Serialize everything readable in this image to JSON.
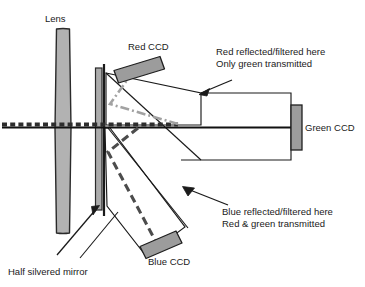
{
  "figure": {
    "background": "#ffffff",
    "ink": "#1a1a1a"
  },
  "colors": {
    "ink": "#1a1a1a",
    "glass_fill": "#ffffff",
    "ccd_fill": "#9a9a9a",
    "lens_fill": "#b0b0b0",
    "mirror_fill": "#a8a8a8",
    "red_ray": "#a0a0a0",
    "blue_ray": "#4a4a4a",
    "axis": "#111111"
  },
  "labels": {
    "lens": "Lens",
    "red_ccd": "Red CCD",
    "blue_ccd": "Blue CCD",
    "green_ccd": "Green CCD",
    "half_silvered_mirror": "Half silvered mirror",
    "red_note_line1": "Red reflected/filtered here",
    "red_note_line2": "Only green transmitted",
    "blue_note_line1": "Blue reflected/filtered here",
    "blue_note_line2": "Red & green transmitted"
  },
  "components": [
    {
      "name": "lens",
      "kind": "optic",
      "label": "Lens"
    },
    {
      "name": "half-silvered-mirror",
      "kind": "optic",
      "label": "Half silvered mirror"
    },
    {
      "name": "red-dichroic-prism",
      "kind": "prism",
      "label": "Red reflected/filtered here"
    },
    {
      "name": "blue-dichroic-prism",
      "kind": "prism",
      "label": "Blue reflected/filtered here"
    },
    {
      "name": "red-ccd",
      "kind": "sensor",
      "label": "Red CCD"
    },
    {
      "name": "green-ccd",
      "kind": "sensor",
      "label": "Green CCD"
    },
    {
      "name": "blue-ccd",
      "kind": "sensor",
      "label": "Blue CCD"
    }
  ],
  "rays": [
    {
      "name": "optical-axis",
      "style": "solid",
      "color": "#111111"
    },
    {
      "name": "red-ray",
      "style": "dash-dot",
      "color": "#a0a0a0"
    },
    {
      "name": "blue-ray",
      "style": "dashed",
      "color": "#4a4a4a"
    },
    {
      "name": "incoming-beam",
      "style": "dashed-thick",
      "color": "#333333"
    }
  ]
}
